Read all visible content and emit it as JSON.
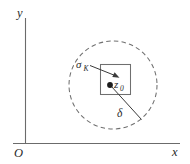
{
  "figure": {
    "name": "neighborhood-diagram",
    "background_color": "#ffffff",
    "line_color": "#6f6f6f",
    "label_color": "#2a2a2a"
  },
  "axes": {
    "y_label": "y",
    "x_label": "x",
    "origin_label": "O"
  },
  "labels": {
    "region_symbol": "σ",
    "region_subscript": "K",
    "point_symbol": "z",
    "point_subscript": "0",
    "radius_symbol": "δ"
  },
  "geometry": {
    "circle_center_x": 113,
    "circle_center_y": 85,
    "circle_radius": 44,
    "square_left": 100,
    "square_top": 64,
    "square_width": 30,
    "square_height": 30,
    "point_x": 110,
    "point_y": 85
  }
}
